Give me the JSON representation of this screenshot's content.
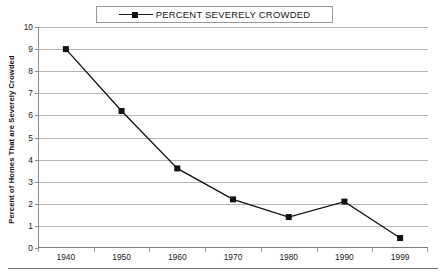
{
  "legend": {
    "entries": [
      {
        "label": "PERCENT SEVERELY CROWDED",
        "color": "#111111",
        "marker": "square"
      }
    ],
    "position": "top-center",
    "boxed": true
  },
  "axes": {
    "ylabel": "Percent of Homes That are Severely Crowded",
    "xlabel": "",
    "yticks": [
      "10",
      "9",
      "8",
      "7",
      "6",
      "5",
      "4",
      "3",
      "2",
      "1",
      "0"
    ],
    "xticks": [
      "1940",
      "1950",
      "1960",
      "1970",
      "1980",
      "1990",
      "1999"
    ]
  },
  "colors": {
    "series": "#111111",
    "grid": "#b4b4b4",
    "axis": "#8c8c8c",
    "text": "#1a1a1a",
    "background": "#ffffff",
    "rule": "#6f6f6f"
  },
  "chart_data": {
    "type": "line",
    "title": "",
    "subtitle": "",
    "xlabel": "",
    "ylabel": "Percent of Homes That are Severely Crowded",
    "categories": [
      "1940",
      "1950",
      "1960",
      "1970",
      "1980",
      "1990",
      "1999"
    ],
    "series": [
      {
        "name": "PERCENT SEVERELY CROWDED",
        "values": [
          9.0,
          6.2,
          3.6,
          2.2,
          1.4,
          2.1,
          0.45
        ],
        "color": "#111111",
        "marker": "square"
      }
    ],
    "ylim": [
      0,
      10
    ],
    "ytick_step": 1,
    "grid": true,
    "grid_axis": "y",
    "legend_position": "top-center",
    "annotations": []
  }
}
